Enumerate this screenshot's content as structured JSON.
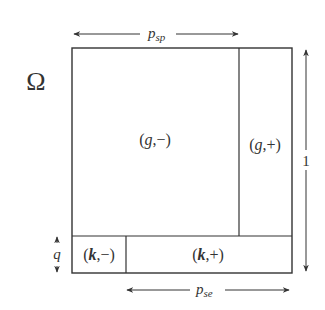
{
  "diagram": {
    "domain_symbol": "Ω",
    "top_dimension": {
      "var": "p",
      "sub": "sp"
    },
    "bottom_dimension": {
      "var": "p",
      "sub": "se"
    },
    "right_dimension": "1",
    "left_dimension": "q",
    "regions": [
      {
        "id": "g-minus",
        "letter": "g",
        "sign": "−",
        "label": "(g,−)"
      },
      {
        "id": "g-plus",
        "letter": "g",
        "sign": "+",
        "label": "(g,+)"
      },
      {
        "id": "k-minus",
        "letter": "k",
        "sign": "−",
        "label": "(k,−)"
      },
      {
        "id": "k-plus",
        "letter": "k",
        "sign": "+",
        "label": "(k,+)"
      }
    ],
    "colors": {
      "line": "#333333",
      "background": "#ffffff"
    }
  }
}
